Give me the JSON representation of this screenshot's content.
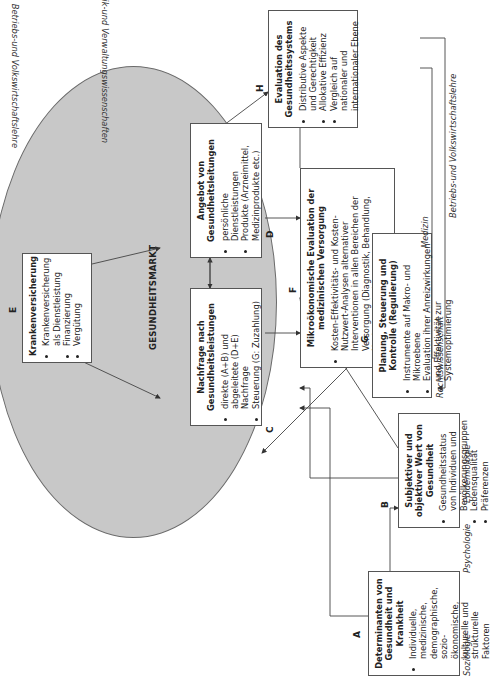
{
  "diagram": {
    "market_label": "GESUNDHEITSMARKT",
    "boxes": {
      "A": {
        "letter": "A",
        "title": "Determinanten von Gesundheit und Krankheit",
        "items": [
          "Individuelle, medizinische, demographische, sozio-ökonomische, kulturelle und strukturelle Faktoren"
        ]
      },
      "B": {
        "letter": "B",
        "title": "Subjektiver und objektiver Wert von Gesundheit",
        "items": [
          "Gesundheitsstatus von Individuen und Bevölkerungsgruppen",
          "Lebensqualität",
          "Präferenzen"
        ]
      },
      "C": {
        "letter": "C",
        "title": "Nachfrage nach Gesundheitsleistungen",
        "items": [
          "direkte (A+B) und abgeleitete (D+E) Nachfrage",
          "Steuerung (G: Zuzahlung)"
        ]
      },
      "D": {
        "letter": "D",
        "title": "Angebot von Gesundheitsleitungen",
        "items": [
          "persönliche Dienstleistungen",
          "Produkte (Arzneimittel, Medizinprodukte etc.)"
        ]
      },
      "E": {
        "letter": "E",
        "title": "Krankenversicherung",
        "items": [
          "Krankenversicherung als Dienstleistung",
          "Finanzierung",
          "Vergütung"
        ]
      },
      "F": {
        "letter": "F",
        "title": "Mikroökonomische Evaluation der medizinischen Versorgung",
        "items": [
          "Kosten-Effektivitäts- und Kosten-Nutzwert-Analysen alternativer Interventionen in allen Bereichen der Versorgung (Diagnostik, Behandlung, Nachsorge etc.)",
          "Entscheidungsanalysen"
        ]
      },
      "G": {
        "letter": "G",
        "title": "Planung, Steuerung und Kontrolle (Regulierung)",
        "items": [
          "Instrumente auf Makro- und Mikroebene",
          "Evaluation ihrer Anreizwirkungen und Effektivität zur Systemoptimierung"
        ]
      },
      "H": {
        "letter": "H",
        "title": "Evaluation des Gesundheitssystems",
        "items": [
          "Distributive Aspekte und Gerechtigkeit",
          "Allokative Effizienz",
          "Vergleich auf nationaler und internationaler Ebene"
        ]
      }
    },
    "disciplines": {
      "soziologie": "Soziologie",
      "psychologie": "Psychologie",
      "epidemiologie": "Epidemiologie",
      "rechtswissenschaft": "Rechtswissenschaft",
      "bwl_vwl_bottom": "Betriebs-und Volkswirtschaftslehre",
      "bwl_vwl_top": "Betriebs-und Volkswirtschaftslehre",
      "politik": "Politik-und Verwaltungswissenschaften",
      "medizin": "Medizin"
    }
  }
}
